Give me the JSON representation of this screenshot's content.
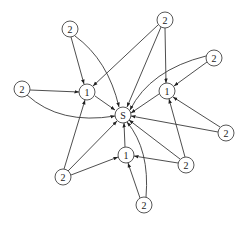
{
  "diagram": {
    "type": "directed-graph",
    "nodes": [
      {
        "id": "s",
        "label": "S",
        "x": 123,
        "y": 115
      },
      {
        "id": "l1a",
        "label": "1",
        "x": 87,
        "y": 92
      },
      {
        "id": "l1b",
        "label": "1",
        "x": 167,
        "y": 91
      },
      {
        "id": "l1c",
        "label": "1",
        "x": 126,
        "y": 155
      },
      {
        "id": "t2a",
        "label": "2",
        "x": 70,
        "y": 29
      },
      {
        "id": "t2b",
        "label": "2",
        "x": 165,
        "y": 20
      },
      {
        "id": "t2c",
        "label": "2",
        "x": 214,
        "y": 58
      },
      {
        "id": "t2d",
        "label": "2",
        "x": 22,
        "y": 89
      },
      {
        "id": "t2e",
        "label": "2",
        "x": 226,
        "y": 133
      },
      {
        "id": "t2f",
        "label": "2",
        "x": 186,
        "y": 165
      },
      {
        "id": "t2g",
        "label": "2",
        "x": 63,
        "y": 177
      },
      {
        "id": "t2h",
        "label": "2",
        "x": 144,
        "y": 205
      }
    ],
    "edges": [
      {
        "from": "l1a",
        "to": "s"
      },
      {
        "from": "l1b",
        "to": "s"
      },
      {
        "from": "l1c",
        "to": "s"
      },
      {
        "from": "t2a",
        "to": "l1a"
      },
      {
        "from": "t2a",
        "to": "s"
      },
      {
        "from": "t2b",
        "to": "l1a"
      },
      {
        "from": "t2b",
        "to": "l1b"
      },
      {
        "from": "t2b",
        "to": "s"
      },
      {
        "from": "t2c",
        "to": "l1b"
      },
      {
        "from": "t2c",
        "to": "s"
      },
      {
        "from": "t2d",
        "to": "l1a"
      },
      {
        "from": "t2d",
        "to": "s"
      },
      {
        "from": "t2e",
        "to": "l1b"
      },
      {
        "from": "t2e",
        "to": "s"
      },
      {
        "from": "t2f",
        "to": "l1b"
      },
      {
        "from": "t2f",
        "to": "l1c"
      },
      {
        "from": "t2f",
        "to": "s"
      },
      {
        "from": "t2g",
        "to": "l1a"
      },
      {
        "from": "t2g",
        "to": "l1c"
      },
      {
        "from": "t2g",
        "to": "s"
      },
      {
        "from": "t2h",
        "to": "l1c"
      },
      {
        "from": "t2h",
        "to": "s"
      }
    ]
  }
}
